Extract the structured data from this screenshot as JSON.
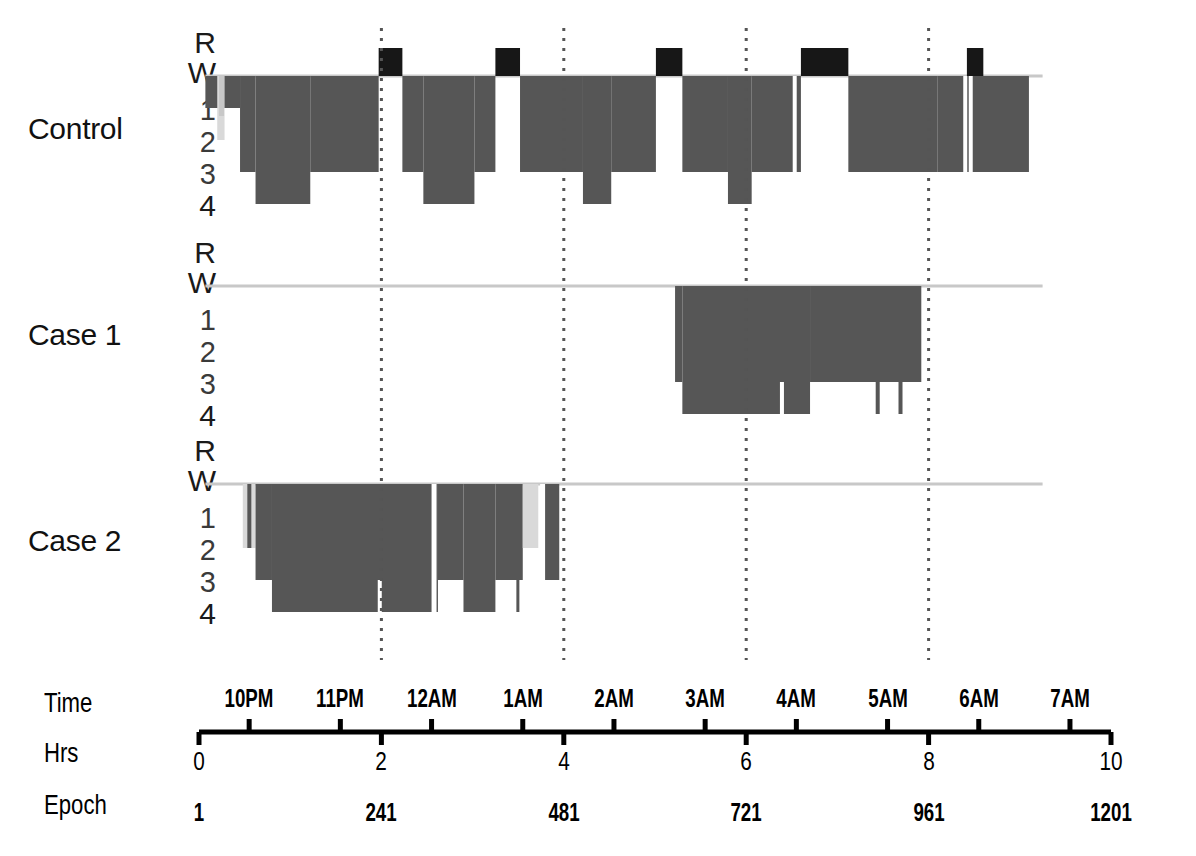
{
  "figure": {
    "type": "hypnogram",
    "background": "#ffffff",
    "colors": {
      "rem": "#171717",
      "sleep": "#565656",
      "light_sleep": "#d9d9d9",
      "wake_line": "#c8c8c8",
      "gridline": "#555555",
      "axis": "#000000"
    }
  },
  "panels": [
    {
      "id": "control",
      "label": "Control"
    },
    {
      "id": "case1",
      "label": "Case 1"
    },
    {
      "id": "case2",
      "label": "Case 2"
    }
  ],
  "stage_axis": {
    "ticks": [
      "R",
      "W",
      "1",
      "2",
      "3",
      "4"
    ]
  },
  "axis_rows": {
    "time_label": "Time",
    "hrs_label": "Hrs",
    "epoch_label": "Epoch"
  },
  "chart_data": {
    "type": "area",
    "title": "",
    "xlabel": "Time / Hrs / Epoch",
    "ylabel": "Sleep stage",
    "grid": true,
    "legend": null,
    "x_axis": {
      "range_hours": [
        0,
        10
      ],
      "time_ticks": [
        "10PM",
        "11PM",
        "12AM",
        "1AM",
        "2AM",
        "3AM",
        "4AM",
        "5AM",
        "6AM",
        "7AM"
      ],
      "time_tick_hours": [
        0.55,
        1.55,
        2.55,
        3.55,
        4.55,
        5.55,
        6.55,
        7.55,
        8.55,
        9.55
      ],
      "hrs_ticks": [
        0,
        2,
        4,
        6,
        8,
        10
      ],
      "epoch_ticks": [
        1,
        241,
        481,
        721,
        961,
        1201
      ],
      "gridline_hours": [
        2,
        4,
        6,
        8
      ]
    },
    "y_axis": {
      "stages": [
        "R",
        "W",
        "1",
        "2",
        "3",
        "4"
      ],
      "stage_levels": {
        "R": 0,
        "W": 1,
        "1": 2,
        "2": 3,
        "3": 4,
        "4": 5
      }
    },
    "series": [
      {
        "name": "Control",
        "recording_hours": [
          0.07,
          9.15
        ],
        "wake_baseline_hours": [
          0.07,
          9.25
        ],
        "segments": [
          {
            "stage": "W",
            "start": 0.07,
            "end": 0.45
          },
          {
            "stage": "1",
            "start": 0.2,
            "end": 0.28
          },
          {
            "stage": "2",
            "start": 0.45,
            "end": 0.62
          },
          {
            "stage": "3",
            "start": 0.62,
            "end": 1.22
          },
          {
            "stage": "2",
            "start": 1.22,
            "end": 1.97
          },
          {
            "stage": "R",
            "start": 1.97,
            "end": 2.23
          },
          {
            "stage": "2",
            "start": 2.23,
            "end": 2.46
          },
          {
            "stage": "3",
            "start": 2.46,
            "end": 3.02
          },
          {
            "stage": "2",
            "start": 3.02,
            "end": 3.25
          },
          {
            "stage": "R",
            "start": 3.25,
            "end": 3.52
          },
          {
            "stage": "2",
            "start": 3.52,
            "end": 4.21
          },
          {
            "stage": "3",
            "start": 4.21,
            "end": 4.52
          },
          {
            "stage": "2",
            "start": 4.52,
            "end": 5.01
          },
          {
            "stage": "R",
            "start": 5.01,
            "end": 5.3
          },
          {
            "stage": "2",
            "start": 5.3,
            "end": 5.8
          },
          {
            "stage": "3",
            "start": 5.8,
            "end": 6.06
          },
          {
            "stage": "2",
            "start": 6.06,
            "end": 6.6
          },
          {
            "stage": "R",
            "start": 6.6,
            "end": 7.12
          },
          {
            "stage": "2",
            "start": 7.12,
            "end": 8.1
          },
          {
            "stage": "R",
            "start": 8.42,
            "end": 8.6
          },
          {
            "stage": "2",
            "start": 8.1,
            "end": 9.1
          }
        ]
      },
      {
        "name": "Case 1",
        "recording_hours": [
          0.07,
          9.25
        ],
        "wake_baseline_hours": [
          0.07,
          9.25
        ],
        "sleep_onset_hour": 5.22,
        "sleep_offset_hour": 7.92,
        "segments": [
          {
            "stage": "2",
            "start": 5.22,
            "end": 5.3
          },
          {
            "stage": "3",
            "start": 5.3,
            "end": 6.7
          },
          {
            "stage": "2",
            "start": 6.7,
            "end": 7.92
          }
        ]
      },
      {
        "name": "Case 2",
        "recording_hours": [
          0.07,
          9.25
        ],
        "wake_baseline_hours": [
          0.07,
          9.25
        ],
        "sleep_onset_hour": 0.48,
        "sleep_offset_hour": 3.95,
        "segments": [
          {
            "stage": "1",
            "start": 0.48,
            "end": 0.62
          },
          {
            "stage": "2",
            "start": 0.62,
            "end": 0.8
          },
          {
            "stage": "3",
            "start": 0.8,
            "end": 2.62
          },
          {
            "stage": "2",
            "start": 2.62,
            "end": 2.9
          },
          {
            "stage": "3",
            "start": 2.9,
            "end": 3.25
          },
          {
            "stage": "2",
            "start": 3.25,
            "end": 3.55
          },
          {
            "stage": "1",
            "start": 3.55,
            "end": 3.72
          },
          {
            "stage": "2",
            "start": 3.78,
            "end": 3.95
          }
        ]
      }
    ]
  }
}
